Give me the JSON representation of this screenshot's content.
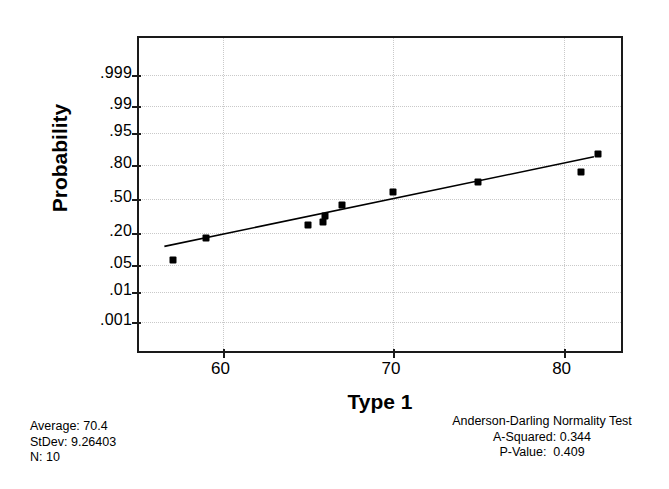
{
  "chart_data": {
    "type": "scatter",
    "title": "",
    "xlabel": "Type 1",
    "ylabel": "Probability",
    "xlim": [
      55.1,
      83.6
    ],
    "x_ticks": [
      60,
      70,
      80
    ],
    "x_tick_labels": [
      "60",
      "70",
      "80"
    ],
    "y_scale": "normal-probability",
    "y_ticks": [
      0.001,
      0.01,
      0.05,
      0.2,
      0.5,
      0.8,
      0.95,
      0.99,
      0.999
    ],
    "y_tick_labels": [
      ".001",
      ".01",
      ".05",
      ".20",
      ".50",
      ".80",
      ".95",
      ".99",
      ".999"
    ],
    "ylim": [
      0.0005,
      0.9995
    ],
    "grid": true,
    "legend": "none",
    "series": [
      {
        "name": "Type 1 sample",
        "marker": "filled-square",
        "x": [
          57.1,
          59.0,
          65.0,
          65.9,
          66.0,
          67.0,
          70.0,
          75.0,
          81.0,
          82.0
        ],
        "y": [
          0.062,
          0.165,
          0.255,
          0.28,
          0.33,
          0.44,
          0.57,
          0.66,
          0.75,
          0.87
        ]
      },
      {
        "name": "normal fit line",
        "type": "line",
        "x_endpoints": [
          56.6,
          82.0
        ],
        "y_endpoints": [
          0.105,
          0.845
        ]
      }
    ]
  },
  "axes": {
    "y_title": "Probability",
    "x_title": "Type 1"
  },
  "stats_left": {
    "average_label": "Average:",
    "average_value": "70.4",
    "stdev_label": "StDev:",
    "stdev_value": "9.26403",
    "n_label": "N:",
    "n_value": "10",
    "line1": "Average: 70.4",
    "line2": "StDev: 9.26403",
    "line3": "N: 10"
  },
  "stats_right": {
    "title": "Anderson-Darling Normality Test",
    "a_squared_label": "A-Squared:",
    "a_squared_value": "0.344",
    "p_value_label": "P-Value:",
    "p_value_value": "0.409",
    "line1": "Anderson-Darling Normality Test",
    "line2": "A-Squared: 0.344",
    "line3": "P-Value:  0.409"
  },
  "colors": {
    "frame": "#1a1a1a",
    "grid": "#c9c9c9",
    "marker": "#000000",
    "fitline": "#000000",
    "background": "#ffffff"
  }
}
